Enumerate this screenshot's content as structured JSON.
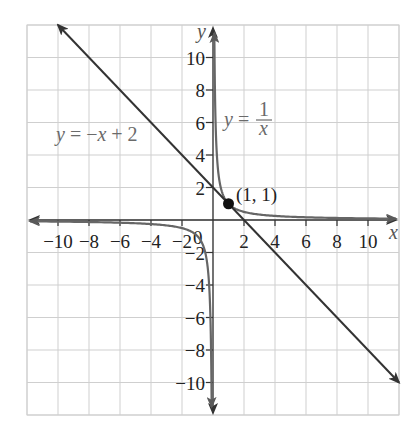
{
  "chart_data": {
    "type": "line",
    "title": "",
    "xlabel": "x",
    "ylabel": "y",
    "xlim": [
      -12,
      12
    ],
    "ylim": [
      -12,
      12
    ],
    "grid": true,
    "grid_step": 2,
    "x_ticks": [
      -10,
      -8,
      -6,
      -4,
      -2,
      2,
      4,
      6,
      8,
      10
    ],
    "y_ticks": [
      10,
      8,
      6,
      4,
      2,
      -2,
      -4,
      -6,
      -8,
      -10
    ],
    "origin_label": "0",
    "series": [
      {
        "name": "y = -x + 2",
        "kind": "linear",
        "slope": -1,
        "intercept": 2,
        "x": [
          -10,
          12
        ],
        "y": [
          12,
          -10
        ],
        "color": "#333333",
        "arrows": "both"
      },
      {
        "name": "y = 1/x",
        "kind": "reciprocal",
        "branches": [
          {
            "x": [
              0.083,
              0.1,
              0.2,
              0.5,
              1,
              2,
              4,
              8,
              12
            ],
            "y": [
              12,
              10,
              5,
              2,
              1,
              0.5,
              0.25,
              0.125,
              0.083
            ]
          },
          {
            "x": [
              -12,
              -8,
              -4,
              -2,
              -1,
              -0.5,
              -0.2,
              -0.1,
              -0.083
            ],
            "y": [
              -0.083,
              -0.125,
              -0.25,
              -0.5,
              -1,
              -2,
              -5,
              -10,
              -12
            ]
          }
        ],
        "color": "#666666",
        "arrows": "both-ends-of-each-branch"
      }
    ],
    "annotations": [
      {
        "type": "point",
        "x": 1,
        "y": 1,
        "label": "(1, 1)"
      },
      {
        "type": "label",
        "text": "y = -x + 2",
        "near": [
          -8,
          5
        ]
      },
      {
        "type": "label",
        "text": "y = 1/x",
        "near": [
          2.5,
          6
        ]
      }
    ]
  },
  "labels": {
    "x_axis": "x",
    "y_axis": "y",
    "origin": "0",
    "point": "(1, 1)",
    "line_eq_y": "y",
    "line_eq_eq": " = ",
    "line_eq_rhs_minus": "−",
    "line_eq_rhs_x": "x",
    "line_eq_rhs_rest": " + 2",
    "curve_eq_y": "y",
    "curve_eq_eq": " = ",
    "curve_eq_num": "1",
    "curve_eq_den": "x",
    "x_ticks": [
      "−10",
      "−8",
      "−6",
      "−4",
      "−2",
      "2",
      "4",
      "6",
      "8",
      "10"
    ],
    "y_ticks": [
      "10",
      "8",
      "6",
      "4",
      "2",
      "−2",
      "−4",
      "−6",
      "−8",
      "−10"
    ]
  }
}
